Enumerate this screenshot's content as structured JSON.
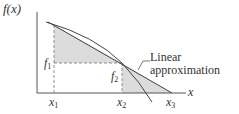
{
  "diagram": {
    "y_axis_label": "f(x)",
    "x_axis_label": "x",
    "x_ticks": [
      {
        "base": "x",
        "sub": "1"
      },
      {
        "base": "x",
        "sub": "2"
      },
      {
        "base": "x",
        "sub": "3"
      }
    ],
    "f_labels": [
      {
        "base": "f",
        "sub": "1"
      },
      {
        "base": "f",
        "sub": "2"
      }
    ],
    "annotation": {
      "line1": "Linear",
      "line2": "approximation"
    },
    "colors": {
      "axis": "#555555",
      "curve": "#444444",
      "shade": "#dcdcdc",
      "dash": "#777777"
    }
  }
}
